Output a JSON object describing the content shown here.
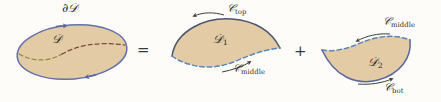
{
  "figure": {
    "background_color": "#fdfcf8",
    "fill_color": "#e3cba5",
    "boundary_color": "#6470a8",
    "solid_curve_color": "#4a5570",
    "dashed_curve_color": "#5b86b8",
    "interior_dash_left_color": "#8a8a3c",
    "interior_dash_right_color": "#7b4a3a",
    "arrow_color": "#3f3f3a",
    "label_color": "#2b2b28"
  },
  "operators": {
    "equals": "=",
    "plus": "+"
  },
  "panels": [
    {
      "id": "panel-region-D",
      "shape": "ellipse",
      "boundary_label": "∂",
      "boundary_label_script": "𝒟",
      "region_label": "𝒟",
      "region_label_sub": "",
      "orientation": "counterclockwise",
      "arrow_count": 2,
      "interior_curve": "dashed"
    },
    {
      "id": "panel-region-D1",
      "shape": "upper-lens",
      "region_label": "𝒟",
      "region_label_sub": "1",
      "top_curve_label": "𝒞",
      "top_curve_sub": "top",
      "bottom_curve_label": "𝒞",
      "bottom_curve_sub": "middle",
      "top_curve_style": "solid",
      "bottom_curve_style": "dashed",
      "arrow_count": 2
    },
    {
      "id": "panel-region-D2",
      "shape": "lower-lens",
      "region_label": "𝒟",
      "region_label_sub": "2",
      "top_curve_label": "𝒞",
      "top_curve_sub": "middle",
      "bottom_curve_label": "𝒞",
      "bottom_curve_sub": "bot",
      "top_curve_style": "dashed",
      "bottom_curve_style": "solid",
      "arrow_count": 2
    }
  ]
}
